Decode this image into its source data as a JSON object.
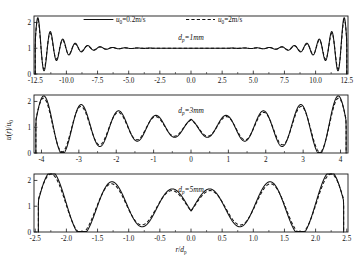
{
  "figure": {
    "axis_label_x": "r/d",
    "axis_label_x_sub": "p",
    "axis_label_y": "u(r)/u",
    "axis_label_y_sub": "0"
  },
  "legend": {
    "series": [
      {
        "symbol": "u",
        "sub": "0",
        "label": "=0.2m/s",
        "style": "solid"
      },
      {
        "symbol": "u",
        "sub": "0",
        "label": "=2m/s",
        "style": "dashed"
      }
    ]
  },
  "panels": [
    {
      "id": "panel-dp-1mm",
      "annotation_symbol": "d",
      "annotation_sub": "p",
      "annotation_value": "=1mm",
      "xticklabels": [
        "-12.5",
        "-10.0",
        "-7.5",
        "-5.0",
        "-2.5",
        "0.0",
        "2.5",
        "5.0",
        "7.5",
        "10.0",
        "12.5"
      ],
      "xtickvalues": [
        -12.5,
        -10.0,
        -7.5,
        -5.0,
        -2.5,
        0.0,
        2.5,
        5.0,
        7.5,
        10.0,
        12.5
      ],
      "yticklabels": [
        "0",
        "1",
        "2"
      ],
      "ytickvalues": [
        0,
        1,
        2
      ],
      "xlim": [
        -12.6,
        12.6
      ],
      "ylim": [
        0,
        2.25
      ]
    },
    {
      "id": "panel-dp-3mm",
      "annotation_symbol": "d",
      "annotation_sub": "p",
      "annotation_value": "=3mm",
      "xticklabels": [
        "-4",
        "-3",
        "-2",
        "-1",
        "0",
        "1",
        "2",
        "3",
        "4"
      ],
      "xtickvalues": [
        -4,
        -3,
        -2,
        -1,
        0,
        1,
        2,
        3,
        4
      ],
      "yticklabels": [
        "0",
        "1",
        "2"
      ],
      "ytickvalues": [
        0,
        1,
        2
      ],
      "xlim": [
        -4.2,
        4.2
      ],
      "ylim": [
        0,
        2.25
      ]
    },
    {
      "id": "panel-dp-5mm",
      "annotation_symbol": "d",
      "annotation_sub": "p",
      "annotation_value": "=5mm",
      "xticklabels": [
        "-2.5",
        "-2.0",
        "-1.5",
        "-1.0",
        "-0.5",
        "0.0",
        "0.5",
        "1.0",
        "1.5",
        "2.0",
        "2.5"
      ],
      "xtickvalues": [
        -2.5,
        -2.0,
        -1.5,
        -1.0,
        -0.5,
        0.0,
        0.5,
        1.0,
        1.5,
        2.0,
        2.5
      ],
      "yticklabels": [
        "0",
        "1",
        "2"
      ],
      "ytickvalues": [
        0,
        1,
        2
      ],
      "xlim": [
        -2.52,
        2.52
      ],
      "ylim": [
        0,
        2.25
      ]
    }
  ],
  "chart_data": {
    "type": "line",
    "title": "",
    "xlabel": "r/dp",
    "ylabel": "u(r)/u0",
    "grid": false,
    "legend_position": "top",
    "subplots": [
      {
        "name": "dp=1mm",
        "xlim": [
          -12.6,
          12.6
        ],
        "ylim": [
          0,
          2.25
        ],
        "xticks": [
          -12.5,
          -10.0,
          -7.5,
          -5.0,
          -2.5,
          0.0,
          2.5,
          5.0,
          7.5,
          10.0,
          12.5
        ],
        "yticks": [
          0,
          1,
          2
        ],
        "description": "Strongly damped wall-bounded oscillation; amplitude decays within ~2 particle diameters of each wall, flat at 1.0 across the core.",
        "envelope_decay_length": 1.6,
        "oscillation_period": 1.0,
        "wall_peak": 2.0,
        "wall_trough": 0.05,
        "core_value": 1.0,
        "series": [
          {
            "name": "u0=0.2m/s",
            "style": "solid"
          },
          {
            "name": "u0=2m/s",
            "style": "dashed"
          }
        ]
      },
      {
        "name": "dp=3mm",
        "xlim": [
          -4.2,
          4.2
        ],
        "ylim": [
          0,
          2.25
        ],
        "xticks": [
          -4,
          -3,
          -2,
          -1,
          0,
          1,
          2,
          3,
          4
        ],
        "yticks": [
          0,
          1,
          2
        ],
        "description": "Moderately damped oscillation; ripples of amplitude ~0.12 persist across the core, wall peaks reach ~2.0 and troughs ~0.25.",
        "envelope_decay_length": 3.2,
        "oscillation_period": 1.0,
        "wall_peak": 2.0,
        "wall_trough": 0.22,
        "core_value": 1.0,
        "series": [
          {
            "name": "u0=0.2m/s",
            "style": "solid"
          },
          {
            "name": "u0=2m/s",
            "style": "dashed"
          }
        ]
      },
      {
        "name": "dp=5mm",
        "xlim": [
          -2.52,
          2.52
        ],
        "ylim": [
          0,
          2.25
        ],
        "xticks": [
          -2.5,
          -2.0,
          -1.5,
          -1.0,
          -0.5,
          0.0,
          0.5,
          1.0,
          1.5,
          2.0,
          2.5
        ],
        "yticks": [
          0,
          1,
          2
        ],
        "description": "Weakly damped oscillation; only ~2.5 particle diameters wide so oscillations span the whole channel. Peaks near +/-2.35 (~2.2), +/-1.45 (~1.15) and +/-0.5 (~1.1); troughs near +/-1.95 (~0.25) and +/-1.0 (~0.82).",
        "envelope_decay_length": 2.6,
        "oscillation_period": 0.95,
        "wall_peak": 2.2,
        "wall_trough": 0.25,
        "core_value": 1.0,
        "series": [
          {
            "name": "u0=0.2m/s",
            "style": "solid"
          },
          {
            "name": "u0=2m/s",
            "style": "dashed"
          }
        ]
      }
    ]
  }
}
